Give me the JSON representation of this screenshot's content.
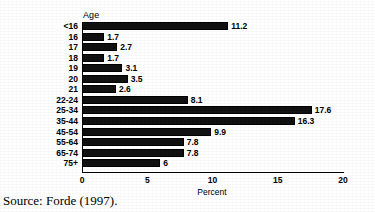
{
  "chart_data": {
    "type": "bar",
    "orientation": "horizontal",
    "title": "",
    "xlabel": "Percent",
    "ylabel": "Age",
    "xlim": [
      0,
      20
    ],
    "xticks": [
      "0",
      "5",
      "10",
      "15",
      "20"
    ],
    "grid": false,
    "legend": false,
    "bar_color": "#000000",
    "categories": [
      "<16",
      "16",
      "17",
      "18",
      "19",
      "20",
      "21",
      "22-24",
      "25-34",
      "35-44",
      "45-54",
      "55-64",
      "65-74",
      "75+"
    ],
    "values": [
      11.2,
      1.7,
      2.7,
      1.7,
      3.1,
      3.5,
      2.6,
      8.1,
      17.6,
      16.3,
      9.9,
      7.8,
      7.8,
      6
    ],
    "value_labels": [
      "11.2",
      "1.7",
      "2.7",
      "1.7",
      "3.1",
      "3.5",
      "2.6",
      "8.1",
      "17.6",
      "16.3",
      "9.9",
      "7.8",
      "7.8",
      "6"
    ]
  },
  "axis": {
    "y_title": "Age",
    "x_title": "Percent",
    "x_tick_labels": [
      "0",
      "5",
      "10",
      "15",
      "20"
    ],
    "x_tick_values": [
      0,
      5,
      10,
      15,
      20
    ]
  },
  "source": {
    "text": "Source: Forde (1997)."
  }
}
